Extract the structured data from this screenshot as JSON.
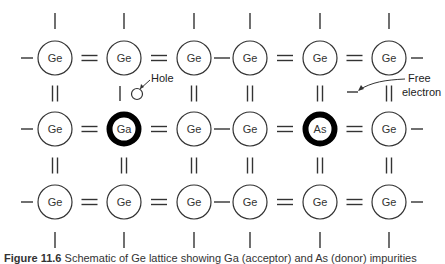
{
  "diagram": {
    "columns_x": [
      55,
      124,
      194,
      250,
      320,
      389
    ],
    "rows_y": [
      58,
      129,
      202
    ],
    "atom_radius": 17,
    "atoms": [
      [
        "Ge",
        "Ge",
        "Ge",
        "Ge",
        "Ge",
        "Ge"
      ],
      [
        "Ge",
        "Ga",
        "Ge",
        "Ge",
        "As",
        "Ge"
      ],
      [
        "Ge",
        "Ge",
        "Ge",
        "Ge",
        "Ge",
        "Ge"
      ]
    ],
    "impurity_atoms": [
      "Ga",
      "As"
    ],
    "horizontal_bonds": [
      "single",
      "double",
      "double",
      "single",
      "double",
      "double",
      "single"
    ],
    "vertical_bonds_top_to_middle": [
      "double",
      "single",
      "double",
      "double",
      "double",
      "double"
    ],
    "vertical_bonds_middle_to_bottom": [
      "double",
      "double",
      "double",
      "double",
      "double",
      "double"
    ],
    "annotations": {
      "hole_label": "Hole",
      "free_electron_label_line1": "Free",
      "free_electron_label_line2": "electron"
    },
    "colors": {
      "line": "#333333",
      "impurity_ring": "#000000",
      "background": "#ffffff"
    }
  },
  "caption": {
    "figure_number": "Figure 11.6",
    "text": "Schematic of Ge lattice showing Ga (acceptor) and As (donor) impurities"
  }
}
